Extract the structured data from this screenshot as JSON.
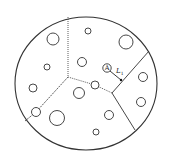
{
  "diagram": {
    "type": "voronoi-cell-particle-diagram",
    "stroke_color": "#333333",
    "background": "#ffffff",
    "boundary": {
      "cx": 86,
      "cy": 83.5,
      "rx": 71,
      "ry": 66.5
    },
    "dividers": [
      {
        "id": "top-vertical",
        "points": [
          [
            68,
            17
          ],
          [
            68,
            77
          ]
        ],
        "style": "dotted"
      },
      {
        "id": "center-to-mid",
        "points": [
          [
            68,
            77
          ],
          [
            95,
            85
          ],
          [
            112,
            93
          ]
        ],
        "style": "dotted"
      },
      {
        "id": "left-diagonal",
        "points": [
          [
            68,
            77
          ],
          [
            36,
            112
          ],
          [
            25,
            121
          ]
        ],
        "style": "dashed"
      },
      {
        "id": "right-upper",
        "points": [
          [
            112,
            93
          ],
          [
            149,
            51
          ]
        ],
        "style": "solid"
      },
      {
        "id": "right-lower",
        "points": [
          [
            112,
            93
          ],
          [
            135,
            130
          ]
        ],
        "style": "solid"
      }
    ],
    "particles": [
      {
        "cx": 53,
        "cy": 39,
        "r": 6
      },
      {
        "cx": 88,
        "cy": 31,
        "r": 3
      },
      {
        "cx": 126,
        "cy": 42,
        "r": 7
      },
      {
        "cx": 82,
        "cy": 62,
        "r": 4.5
      },
      {
        "cx": 47,
        "cy": 67,
        "r": 3
      },
      {
        "cx": 33,
        "cy": 88,
        "r": 4
      },
      {
        "cx": 36,
        "cy": 112,
        "r": 4.5
      },
      {
        "cx": 57,
        "cy": 118,
        "r": 7.5
      },
      {
        "cx": 79,
        "cy": 93,
        "r": 5.5
      },
      {
        "cx": 95,
        "cy": 85,
        "r": 4
      },
      {
        "cx": 109,
        "cy": 115,
        "r": 4.5
      },
      {
        "cx": 96,
        "cy": 132,
        "r": 3
      },
      {
        "cx": 143,
        "cy": 77,
        "r": 4.5
      },
      {
        "cx": 141,
        "cy": 102,
        "r": 4.5
      }
    ],
    "marked_particle": {
      "cx": 107,
      "cy": 68,
      "r": 4.2,
      "label": "A"
    },
    "distance_line": {
      "from": [
        110,
        71
      ],
      "to": [
        121,
        80
      ],
      "label": "L",
      "subscript": "1",
      "label_x": 116,
      "label_y": 73
    }
  }
}
